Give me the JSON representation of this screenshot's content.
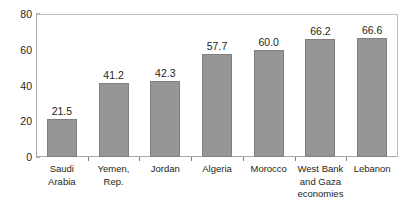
{
  "chart_data": {
    "type": "bar",
    "title": "",
    "subtitle": "",
    "xlabel": "",
    "ylabel": "",
    "ylim": [
      0,
      80
    ],
    "yticks": [
      0,
      20,
      40,
      60,
      80
    ],
    "grid": false,
    "legend": false,
    "legend_position": "none",
    "orientation": "vertical",
    "bar_color": "#969696",
    "bar_edge_color": "#808080",
    "axis_color": "#a7a9ac",
    "text_color": "#231f20",
    "categories": [
      "Saudi Arabia",
      "Yemen, Rep.",
      "Jordan",
      "Algeria",
      "Morocco",
      "West Bank and Gaza economies",
      "Lebanon"
    ],
    "category_lines": [
      [
        "Saudi",
        "Arabia"
      ],
      [
        "Yemen,",
        "Rep."
      ],
      [
        "Jordan"
      ],
      [
        "Algeria"
      ],
      [
        "Morocco"
      ],
      [
        "West Bank",
        "and Gaza",
        "economies"
      ],
      [
        "Lebanon"
      ]
    ],
    "values": [
      21.5,
      41.2,
      42.3,
      57.7,
      60.0,
      66.2,
      66.6
    ],
    "value_labels": [
      "21.5",
      "41.2",
      "42.3",
      "57.7",
      "60.0",
      "66.2",
      "66.6"
    ]
  }
}
